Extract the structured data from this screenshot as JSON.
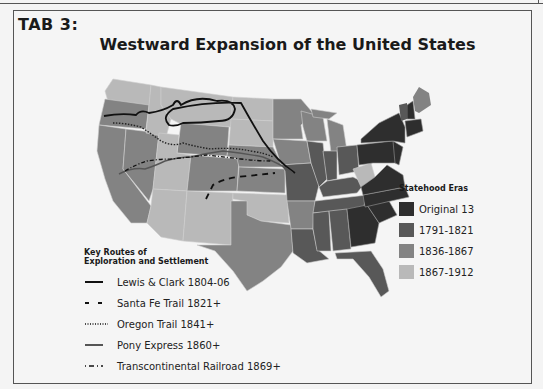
{
  "tab": {
    "label": "TAB 3:"
  },
  "map": {
    "title": "Westward Expansion of the United States",
    "colors": {
      "original_13": "#2e2e2e",
      "era_1791_1821": "#585858",
      "era_1836_1867": "#838383",
      "era_1867_1912": "#b9b9b9",
      "background": "#f5f5f5",
      "route_line": "#111111"
    }
  },
  "legend_eras": {
    "title": "Statehood Eras",
    "items": [
      {
        "label": "Original 13",
        "color": "#2e2e2e"
      },
      {
        "label": "1791-1821",
        "color": "#585858"
      },
      {
        "label": "1836-1867",
        "color": "#838383"
      },
      {
        "label": "1867-1912",
        "color": "#b9b9b9"
      }
    ]
  },
  "legend_routes": {
    "title_line1": "Key Routes of",
    "title_line2": "Exploration and Settlement",
    "items": [
      {
        "label": "Lewis & Clark 1804-06",
        "style": "solid-thick"
      },
      {
        "label": "Santa Fe Trail 1821+",
        "style": "long-dash"
      },
      {
        "label": "Oregon Trail 1841+",
        "style": "dotted"
      },
      {
        "label": "Pony Express 1860+",
        "style": "solid-gray"
      },
      {
        "label": "Transcontinental Railroad 1869+",
        "style": "dash-dot"
      }
    ]
  }
}
